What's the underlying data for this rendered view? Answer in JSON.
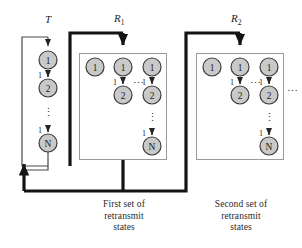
{
  "figure": {
    "type": "state-transition-diagram",
    "background": "#ffffff",
    "ink_color": "#1c1c1c",
    "node_fill": "#c9c9c9",
    "node_stroke": "#3d3d3d",
    "thin_line_color": "#4a4a4a",
    "thick_line_color": "#1a1a1a"
  },
  "groups": [
    {
      "id": "transmit",
      "label": "T",
      "label_sub": "",
      "boxed": false,
      "columns": [
        {
          "nodes": [
            "1",
            "2",
            "N"
          ],
          "edge_labels": [
            "",
            "1",
            "1"
          ],
          "vertical_ellipsis": true
        }
      ]
    },
    {
      "id": "retransmit-1",
      "label": "R",
      "label_sub": "1",
      "boxed": true,
      "columns": [
        {
          "nodes": [
            "1"
          ],
          "edge_labels": [],
          "vertical_ellipsis": false
        },
        {
          "nodes": [
            "1",
            "2"
          ],
          "edge_labels": [
            "",
            "1"
          ],
          "vertical_ellipsis": false
        },
        {
          "nodes": [
            "1",
            "2",
            "N"
          ],
          "edge_labels": [
            "",
            "1",
            "1"
          ],
          "vertical_ellipsis": true
        }
      ],
      "inner_ellipsis": "⋯",
      "caption": [
        "First set of",
        "retransmit",
        "states"
      ]
    },
    {
      "id": "retransmit-2",
      "label": "R",
      "label_sub": "2",
      "boxed": true,
      "columns": [
        {
          "nodes": [
            "1"
          ],
          "edge_labels": [],
          "vertical_ellipsis": false
        },
        {
          "nodes": [
            "1",
            "2"
          ],
          "edge_labels": [
            "",
            "1"
          ],
          "vertical_ellipsis": false
        },
        {
          "nodes": [
            "1",
            "2",
            "N"
          ],
          "edge_labels": [
            "",
            "1",
            "1"
          ],
          "vertical_ellipsis": true
        }
      ],
      "inner_ellipsis": "⋯",
      "trailing_ellipsis": "⋯",
      "caption": [
        "Second set of",
        "retransmit",
        "states"
      ]
    }
  ],
  "labels": {
    "t": "T",
    "r1": "R",
    "r1_sub": "1",
    "r2": "R",
    "r2_sub": "2",
    "edge_one": "1",
    "vertical_ellipsis": "⋮",
    "horizontal_ellipsis": "⋯",
    "caption1_line1": "First set of",
    "caption1_line2": "retransmit",
    "caption1_line3": "states",
    "caption2_line1": "Second set of",
    "caption2_line2": "retransmit",
    "caption2_line3": "states"
  },
  "nodes": {
    "t_1": "1",
    "t_2": "2",
    "t_N": "N",
    "r1c1_1": "1",
    "r1c2_1": "1",
    "r1c2_2": "2",
    "r1c3_1": "1",
    "r1c3_2": "2",
    "r1c3_N": "N",
    "r2c1_1": "1",
    "r2c2_1": "1",
    "r2c2_2": "2",
    "r2c3_1": "1",
    "r2c3_2": "2",
    "r2c3_N": "N"
  }
}
